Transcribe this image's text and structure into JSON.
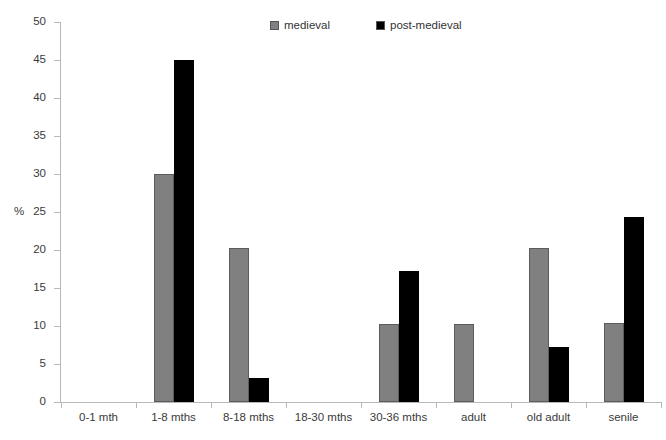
{
  "chart_data": {
    "type": "bar",
    "title": "",
    "subtitle": "",
    "xlabel": "",
    "ylabel": "%",
    "ylim": [
      0,
      50
    ],
    "y_ticks": [
      0,
      5,
      10,
      15,
      20,
      25,
      30,
      35,
      40,
      45,
      50
    ],
    "grid": false,
    "legend_position": "top-center",
    "categories": [
      "0-1 mth",
      "1-8 mths",
      "8-18 mths",
      "18-30 mths",
      "30-36 mths",
      "adult",
      "old adult",
      "senile"
    ],
    "series": [
      {
        "name": "medieval",
        "color": "#808080",
        "values": [
          0,
          30.0,
          20.2,
          0,
          10.3,
          10.3,
          20.3,
          10.4
        ]
      },
      {
        "name": "post-medieval",
        "color": "#000000",
        "values": [
          0,
          45.0,
          3.2,
          0,
          17.2,
          0,
          7.3,
          24.4
        ]
      }
    ]
  },
  "axis": {
    "y_title": "%",
    "y_tick_labels": [
      "0",
      "5",
      "10",
      "15",
      "20",
      "25",
      "30",
      "35",
      "40",
      "45",
      "50"
    ]
  },
  "legend": {
    "items": [
      {
        "label": "medieval",
        "swatch_color": "#808080"
      },
      {
        "label": "post-medieval",
        "swatch_color": "#000000"
      }
    ]
  }
}
